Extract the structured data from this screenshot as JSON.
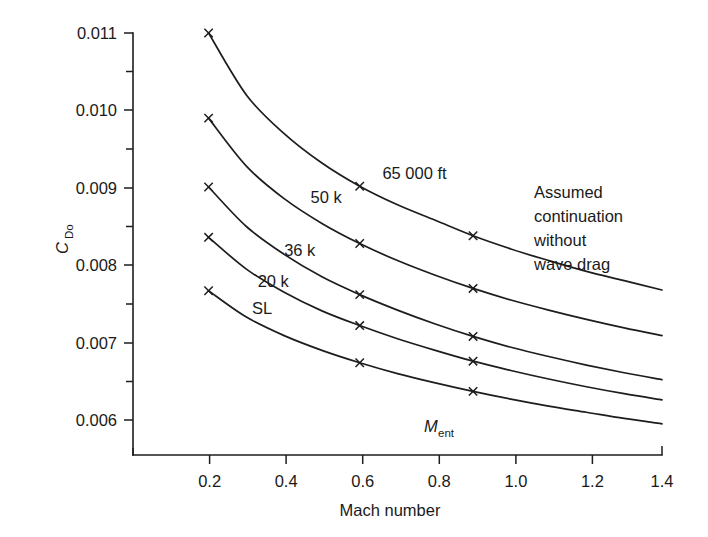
{
  "figure": {
    "background_color": "#ffffff",
    "line_color": "#1d1d1d"
  },
  "axes": {
    "x": {
      "title": "Mach number",
      "tick_labels": [
        "0.2",
        "0.4",
        "0.6",
        "0.8",
        "1.0",
        "1.2",
        "1.4"
      ],
      "tick_values": [
        0.2,
        0.4,
        0.6,
        0.8,
        1.0,
        1.2,
        1.4
      ],
      "range": [
        0.0,
        1.4
      ]
    },
    "y": {
      "title_main": "C",
      "title_sub": "Do",
      "tick_labels": [
        "0.011",
        "0.010",
        "0.009",
        "0.008",
        "0.007",
        "0.006"
      ],
      "tick_values": [
        0.011,
        0.01,
        0.009,
        0.008,
        0.007,
        0.006
      ],
      "range": [
        0.0057,
        0.0113
      ],
      "minor_ticks": [
        0.0105,
        0.0095,
        0.0085,
        0.0075,
        0.0065
      ]
    }
  },
  "annotations": {
    "m_ent": {
      "main": "M",
      "sub": "ent"
    },
    "wave_drag": {
      "lines": [
        "Assumed",
        "continuation",
        "without",
        "wave drag"
      ]
    }
  },
  "chart_data": {
    "type": "line",
    "title": "",
    "xlabel": "Mach number",
    "ylabel": "C_Do",
    "xlim": [
      0.0,
      1.4
    ],
    "ylim": [
      0.0057,
      0.0113
    ],
    "grid": false,
    "legend": "inline curve labels",
    "marker_x_values": [
      0.2,
      0.6,
      0.9
    ],
    "series": [
      {
        "name": "65 000 ft",
        "label": "65 000 ft",
        "x": [
          0.2,
          0.3,
          0.4,
          0.5,
          0.6,
          0.7,
          0.8,
          0.9,
          1.0,
          1.1,
          1.2,
          1.3,
          1.4
        ],
        "y": [
          0.011,
          0.0102,
          0.0097,
          0.00932,
          0.00902,
          0.00878,
          0.00858,
          0.00838,
          0.00821,
          0.00806,
          0.00792,
          0.0078,
          0.00768
        ]
      },
      {
        "name": "50 k",
        "label": "50 k",
        "x": [
          0.2,
          0.3,
          0.4,
          0.5,
          0.6,
          0.7,
          0.8,
          0.9,
          1.0,
          1.1,
          1.2,
          1.3,
          1.4
        ],
        "y": [
          0.0099,
          0.00928,
          0.00886,
          0.00854,
          0.00828,
          0.00806,
          0.00787,
          0.0077,
          0.00755,
          0.00742,
          0.0073,
          0.00719,
          0.00709
        ]
      },
      {
        "name": "36 k",
        "label": "36 k",
        "x": [
          0.2,
          0.3,
          0.4,
          0.5,
          0.6,
          0.7,
          0.8,
          0.9,
          1.0,
          1.1,
          1.2,
          1.3,
          1.4
        ],
        "y": [
          0.00901,
          0.0085,
          0.00814,
          0.00785,
          0.00762,
          0.00742,
          0.00724,
          0.00708,
          0.00694,
          0.00682,
          0.00671,
          0.00661,
          0.00652
        ]
      },
      {
        "name": "20 k",
        "label": "20 k",
        "x": [
          0.2,
          0.3,
          0.4,
          0.5,
          0.6,
          0.7,
          0.8,
          0.9,
          1.0,
          1.1,
          1.2,
          1.3,
          1.4
        ],
        "y": [
          0.00836,
          0.00795,
          0.00765,
          0.00741,
          0.00722,
          0.00705,
          0.0069,
          0.00676,
          0.00664,
          0.00653,
          0.00643,
          0.00634,
          0.00626
        ]
      },
      {
        "name": "SL",
        "label": "SL",
        "x": [
          0.2,
          0.3,
          0.4,
          0.5,
          0.6,
          0.7,
          0.8,
          0.9,
          1.0,
          1.1,
          1.2,
          1.3,
          1.4
        ],
        "y": [
          0.00767,
          0.00733,
          0.00709,
          0.0069,
          0.00674,
          0.0066,
          0.00648,
          0.00637,
          0.00627,
          0.00618,
          0.0061,
          0.00602,
          0.00595
        ]
      }
    ],
    "curve_label_positions": [
      {
        "label": "65 000 ft",
        "x": 0.66,
        "y": 0.00912
      },
      {
        "label": "50 k",
        "x": 0.47,
        "y": 0.0088
      },
      {
        "label": "36 k",
        "x": 0.4,
        "y": 0.00812
      },
      {
        "label": "20 k",
        "x": 0.33,
        "y": 0.00772
      },
      {
        "label": "SL",
        "x": 0.315,
        "y": 0.00737
      }
    ]
  }
}
